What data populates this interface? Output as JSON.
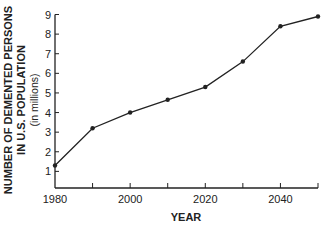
{
  "chart_data": {
    "type": "line",
    "title": "",
    "xlabel": "YEAR",
    "ylabel_lines": [
      "NUMBER OF DEMENTED PERSONS",
      "IN U.S. POPULATION",
      "(in millions)"
    ],
    "x": [
      1980,
      1990,
      2000,
      2010,
      2020,
      2030,
      2040,
      2050
    ],
    "series": [
      {
        "name": "Demented persons (millions)",
        "values": [
          1.3,
          3.2,
          4.0,
          4.65,
          5.3,
          6.6,
          8.4,
          8.9
        ]
      }
    ],
    "xticks": [
      1980,
      1990,
      2000,
      2010,
      2020,
      2030,
      2040,
      2050
    ],
    "xtick_labels": [
      "1980",
      "",
      "2000",
      "",
      "2020",
      "",
      "2040",
      ""
    ],
    "yticks": [
      1,
      2,
      3,
      4,
      5,
      6,
      7,
      8,
      9
    ],
    "ytick_labels": [
      "1",
      "2",
      "3",
      "4",
      "5",
      "6",
      "7",
      "8",
      "9"
    ],
    "xlim": [
      1980,
      2050
    ],
    "ylim": [
      0,
      9
    ],
    "grid": false,
    "legend": null,
    "line_color": "#222222",
    "marker": "circle"
  }
}
